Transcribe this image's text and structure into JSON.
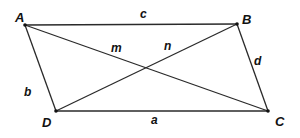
{
  "diagram": {
    "type": "parallelogram-with-diagonals",
    "vertices": {
      "A": "A",
      "B": "B",
      "C": "C",
      "D": "D"
    },
    "sides": {
      "AB": "c",
      "BC": "d",
      "CD": "a",
      "DA": "b"
    },
    "diagonals": {
      "AC": "m",
      "BD": "n"
    },
    "colors": {
      "line": "#2a2a2a",
      "text": "#111111",
      "background": "#ffffff"
    }
  }
}
